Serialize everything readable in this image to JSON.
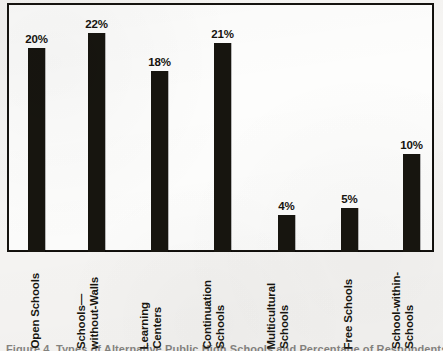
{
  "figure": {
    "background_color": "#f6f5f3",
    "frame_color": "#15130f",
    "bar_color": "#17150f",
    "caption_partial": "Figure 4. Types of Alternative Public High Schools and Percentage of Respondents"
  },
  "chart_data": {
    "type": "bar",
    "title": "",
    "xlabel": "",
    "ylabel": "",
    "grid": false,
    "legend": "none",
    "value_labels_shown": true,
    "axis_tick_labels": [],
    "ylim": [
      0,
      24
    ],
    "categories": [
      "Open Schools",
      "Schools—without-Walls",
      "Learning Centers",
      "Continuation Schools",
      "Multicultural Schools",
      "Free Schools",
      "School-within-Schools"
    ],
    "values": [
      20,
      22,
      18,
      21,
      4,
      5,
      10
    ],
    "value_labels": [
      "20%",
      "22%",
      "18%",
      "21%",
      "4%",
      "5%",
      "10%"
    ],
    "bars": [
      {
        "label": "Open Schools",
        "value": 20,
        "value_label": "20%",
        "label_lines": [
          "Open Schools"
        ],
        "x": 21,
        "width": 17,
        "height": 204
      },
      {
        "label": "Schools—without-Walls",
        "value": 22,
        "value_label": "22%",
        "label_lines": [
          "Schools—",
          "without-Walls"
        ],
        "x": 81,
        "width": 17,
        "height": 219
      },
      {
        "label": "Learning Centers",
        "value": 18,
        "value_label": "18%",
        "label_lines": [
          "Learning",
          "Centers"
        ],
        "x": 144,
        "width": 17,
        "height": 181
      },
      {
        "label": "Continuation Schools",
        "value": 21,
        "value_label": "21%",
        "label_lines": [
          "Continuation",
          "Schools"
        ],
        "x": 207,
        "width": 17,
        "height": 209
      },
      {
        "label": "Multicultural Schools",
        "value": 4,
        "value_label": "4%",
        "label_lines": [
          "Multicultural",
          "Schools"
        ],
        "x": 271,
        "width": 17,
        "height": 37
      },
      {
        "label": "Free Schools",
        "value": 5,
        "value_label": "5%",
        "label_lines": [
          "Free Schools"
        ],
        "x": 334,
        "width": 17,
        "height": 44
      },
      {
        "label": "School-within-Schools",
        "value": 10,
        "value_label": "10%",
        "label_lines": [
          "School-within-",
          "Schools"
        ],
        "x": 396,
        "width": 17,
        "height": 98
      }
    ]
  }
}
